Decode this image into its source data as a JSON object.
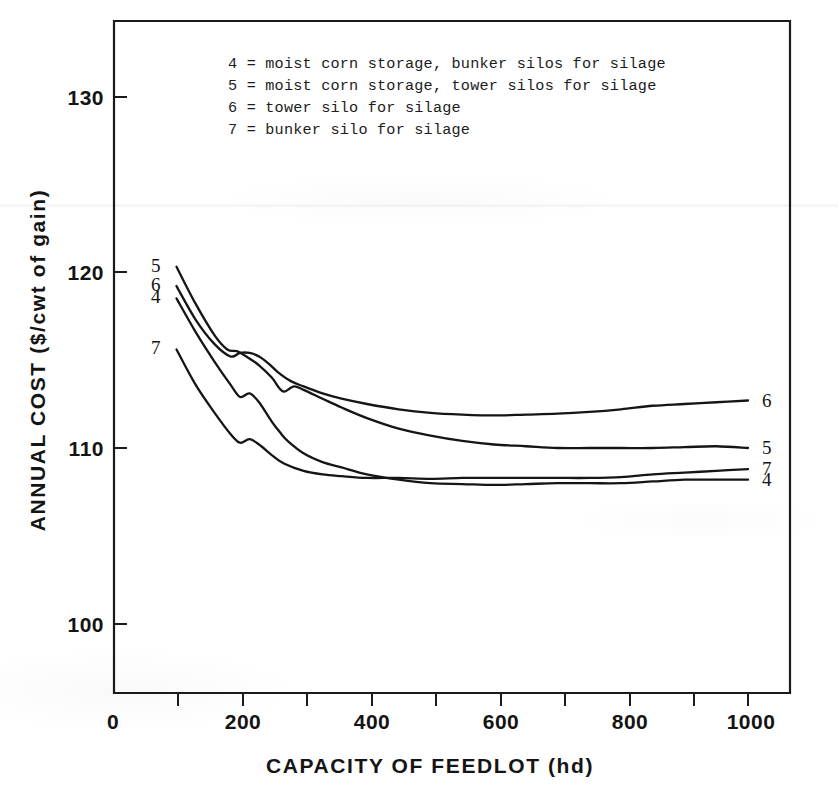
{
  "chart_data": {
    "type": "line",
    "title": "",
    "xlabel": "CAPACITY OF FEEDLOT (hd)",
    "ylabel": "ANNUAL COST ($/cwt of gain)",
    "xlim": [
      0,
      1050
    ],
    "ylim": [
      96,
      134
    ],
    "grid": false,
    "legend_position": "top-left inside plot",
    "xticks_major": [
      "0",
      "200",
      "400",
      "600",
      "800",
      "1000"
    ],
    "xtick_major_values": [
      0,
      200,
      400,
      600,
      800,
      1000
    ],
    "xtick_minor_values": [
      100,
      300,
      500,
      700,
      900
    ],
    "yticks": [
      "100",
      "110",
      "120",
      "130"
    ],
    "ytick_values": [
      100,
      110,
      120,
      130
    ],
    "legend_entries": [
      {
        "key": "4",
        "label": "4 = moist corn storage, bunker silos for silage"
      },
      {
        "key": "5",
        "label": "5 = moist corn storage, tower silos for silage"
      },
      {
        "key": "6",
        "label": "6 = tower silo for silage"
      },
      {
        "key": "7",
        "label": "7 = bunker silo for silage"
      }
    ],
    "series": [
      {
        "name": "4",
        "start_label": "4",
        "end_label": "4",
        "x": [
          100,
          130,
          160,
          185,
          200,
          215,
          230,
          250,
          265,
          275,
          300,
          330,
          360,
          400,
          450,
          500,
          550,
          600,
          650,
          700,
          750,
          800,
          850,
          900,
          950,
          1000
        ],
        "values": [
          118.5,
          116.6,
          114.9,
          113.6,
          112.9,
          113.1,
          112.6,
          111.5,
          110.8,
          110.4,
          109.7,
          109.2,
          108.9,
          108.5,
          108.2,
          108.0,
          107.95,
          107.9,
          107.95,
          108.0,
          108.0,
          108.0,
          108.1,
          108.2,
          108.2,
          108.2
        ]
      },
      {
        "name": "5",
        "start_label": "5",
        "end_label": "5",
        "x": [
          100,
          130,
          160,
          180,
          195,
          210,
          230,
          250,
          262,
          270,
          285,
          300,
          330,
          360,
          400,
          450,
          500,
          550,
          600,
          650,
          700,
          750,
          800,
          850,
          900,
          950,
          1000
        ],
        "values": [
          120.3,
          118.2,
          116.4,
          115.6,
          115.5,
          115.2,
          114.7,
          114.0,
          113.4,
          113.2,
          113.5,
          113.3,
          112.8,
          112.3,
          111.7,
          111.1,
          110.7,
          110.4,
          110.2,
          110.1,
          110.0,
          110.0,
          110.0,
          110.0,
          110.05,
          110.1,
          110.0
        ]
      },
      {
        "name": "6",
        "start_label": "6",
        "end_label": "6",
        "x": [
          100,
          130,
          160,
          185,
          200,
          215,
          230,
          245,
          260,
          280,
          300,
          330,
          360,
          400,
          450,
          500,
          550,
          600,
          650,
          700,
          750,
          800,
          850,
          900,
          950,
          1000
        ],
        "values": [
          119.2,
          117.3,
          115.9,
          115.2,
          115.4,
          115.4,
          115.2,
          114.8,
          114.3,
          113.8,
          113.5,
          113.1,
          112.8,
          112.5,
          112.2,
          112.0,
          111.9,
          111.85,
          111.9,
          111.95,
          112.05,
          112.2,
          112.4,
          112.5,
          112.6,
          112.7
        ]
      },
      {
        "name": "7",
        "start_label": "7",
        "end_label": "7",
        "x": [
          100,
          130,
          160,
          185,
          200,
          215,
          230,
          250,
          270,
          300,
          330,
          360,
          400,
          450,
          500,
          550,
          600,
          650,
          700,
          750,
          800,
          850,
          900,
          950,
          1000
        ],
        "values": [
          115.6,
          113.6,
          112.0,
          110.8,
          110.3,
          110.5,
          110.2,
          109.6,
          109.1,
          108.7,
          108.5,
          108.4,
          108.3,
          108.3,
          108.25,
          108.3,
          108.3,
          108.3,
          108.3,
          108.3,
          108.35,
          108.5,
          108.6,
          108.7,
          108.8
        ]
      }
    ]
  },
  "axis_titles": {
    "x": "CAPACITY OF FEEDLOT (hd)",
    "y": "ANNUAL COST ($/cwt of gain)"
  }
}
